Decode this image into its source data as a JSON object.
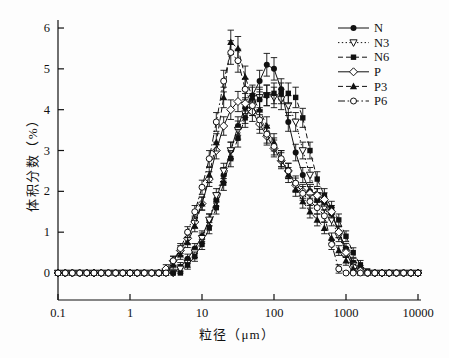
{
  "colors": {
    "ink": "#111111",
    "background": "#fdfdfd",
    "marker_fill_open": "#ffffff"
  },
  "chart_data": {
    "type": "line",
    "x_scale": "log",
    "title": "",
    "xlabel": "粒径（μm）",
    "ylabel": "体积分数（%）",
    "xlim": [
      0.1,
      10000
    ],
    "ylim": [
      -0.66,
      6
    ],
    "grid": false,
    "legend_position": "top-right",
    "error_bars": true,
    "x_ticks": [
      0.1,
      1,
      10,
      100,
      1000,
      10000
    ],
    "x_tick_labels": [
      "0.1",
      "1",
      "10",
      "100",
      "1000",
      "10000"
    ],
    "y_ticks": [
      0,
      1,
      2,
      3,
      4,
      5,
      6
    ],
    "y_tick_labels": [
      "0",
      "1",
      "2",
      "3",
      "4",
      "5",
      "6"
    ],
    "x": [
      0.1,
      0.126,
      0.158,
      0.2,
      0.251,
      0.316,
      0.398,
      0.501,
      0.631,
      0.794,
      1,
      1.26,
      1.58,
      2,
      2.51,
      3.16,
      3.98,
      5.01,
      6.31,
      7.94,
      10,
      12.6,
      15.8,
      20,
      25.1,
      31.6,
      39.8,
      50.1,
      63.1,
      79.4,
      100,
      126,
      158,
      200,
      251,
      316,
      398,
      501,
      631,
      794,
      1000,
      1259,
      1585,
      1995,
      2512,
      3162,
      3981,
      5012,
      6310,
      7943,
      10000
    ],
    "series": [
      {
        "name": "N",
        "marker": "filled-circle",
        "line": "solid",
        "values": [
          0,
          0,
          0,
          0,
          0,
          0,
          0,
          0,
          0,
          0,
          0,
          0,
          0,
          0,
          0,
          0,
          0,
          0.15,
          0.35,
          0.6,
          0.9,
          1.3,
          1.8,
          2.4,
          3.0,
          3.6,
          4.05,
          4.35,
          4.7,
          5.1,
          5.0,
          4.5,
          3.7,
          2.95,
          2.4,
          2.0,
          1.8,
          1.7,
          1.45,
          1.0,
          0.6,
          0.25,
          0.08,
          0,
          0,
          0,
          0,
          0,
          0,
          0,
          0
        ]
      },
      {
        "name": "N3",
        "marker": "open-triangle-down",
        "line": "dotted",
        "values": [
          0,
          0,
          0,
          0,
          0,
          0,
          0,
          0,
          0,
          0,
          0,
          0,
          0,
          0,
          0,
          0,
          0,
          0.1,
          0.25,
          0.5,
          0.85,
          1.3,
          1.9,
          2.5,
          3.0,
          3.5,
          3.9,
          4.15,
          4.3,
          4.35,
          4.3,
          4.25,
          4.1,
          3.7,
          3.0,
          2.4,
          1.9,
          1.6,
          1.3,
          0.9,
          0.5,
          0.2,
          0.05,
          0,
          0,
          0,
          0,
          0,
          0,
          0,
          0
        ]
      },
      {
        "name": "N6",
        "marker": "filled-square",
        "line": "dashed",
        "values": [
          0,
          0,
          0,
          0,
          0,
          0,
          0,
          0,
          0,
          0,
          0,
          0,
          0,
          0,
          0,
          0,
          0,
          0,
          0.2,
          0.4,
          0.7,
          1.1,
          1.6,
          2.2,
          2.8,
          3.3,
          3.8,
          4.1,
          4.25,
          4.35,
          4.4,
          4.4,
          4.4,
          4.3,
          3.8,
          3.0,
          2.3,
          1.9,
          1.6,
          1.3,
          0.9,
          0.5,
          0.2,
          0.05,
          0,
          0,
          0,
          0,
          0,
          0,
          0
        ]
      },
      {
        "name": "P",
        "marker": "open-diamond",
        "line": "solid",
        "values": [
          0,
          0,
          0,
          0,
          0,
          0,
          0,
          0,
          0,
          0,
          0,
          0,
          0,
          0,
          0,
          0.1,
          0.3,
          0.55,
          0.85,
          1.25,
          1.7,
          2.3,
          3.0,
          3.6,
          4.0,
          4.2,
          4.15,
          3.95,
          3.65,
          3.35,
          3.05,
          2.75,
          2.5,
          2.15,
          2.0,
          1.95,
          1.9,
          1.8,
          1.5,
          1.0,
          0.5,
          0.15,
          0.05,
          0,
          0,
          0,
          0,
          0,
          0,
          0,
          0
        ]
      },
      {
        "name": "P3",
        "marker": "filled-triangle-up",
        "line": "dashed",
        "values": [
          0,
          0,
          0,
          0,
          0,
          0,
          0,
          0,
          0,
          0,
          0,
          0,
          0,
          0,
          0,
          0,
          0.2,
          0.45,
          0.75,
          1.15,
          1.7,
          2.4,
          3.2,
          4.3,
          5.65,
          5.5,
          4.8,
          4.3,
          4.0,
          3.6,
          3.2,
          2.8,
          2.4,
          2.05,
          1.75,
          1.5,
          1.3,
          1.1,
          0.85,
          0.55,
          0.3,
          0.1,
          0,
          0,
          0,
          0,
          0,
          0,
          0,
          0,
          0
        ]
      },
      {
        "name": "P6",
        "marker": "open-circle",
        "line": "dash-dot",
        "values": [
          0,
          0,
          0,
          0,
          0,
          0,
          0,
          0,
          0,
          0,
          0,
          0,
          0,
          0,
          0,
          0,
          0.3,
          0.6,
          1.0,
          1.5,
          2.1,
          2.8,
          3.7,
          4.7,
          5.4,
          5.2,
          4.5,
          4.1,
          3.75,
          3.4,
          3.1,
          2.8,
          2.5,
          2.2,
          1.95,
          1.75,
          1.6,
          1.4,
          0.7,
          0.1,
          0,
          0,
          0,
          0,
          0,
          0,
          0,
          0,
          0,
          0,
          0
        ]
      }
    ]
  }
}
